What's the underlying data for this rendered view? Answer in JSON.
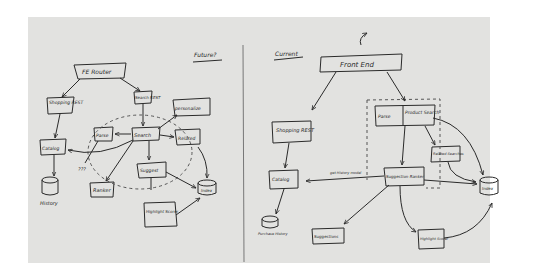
{
  "diagram": {
    "medium": "hand-drawn sketch on paper",
    "sections": {
      "future": {
        "title": "Future?",
        "nodes": {
          "fe_router": "FE Router",
          "shopping_rest": "Shopping REST",
          "search_rest": "Search REST",
          "personalize": "personalize",
          "search": "Search",
          "parse": "Parse",
          "related": "Related",
          "catalog": "Catalog",
          "history": "History",
          "unknown": "???",
          "ranker": "Ranker",
          "suggest": "Suggest",
          "index": "Index",
          "highlight_scorer": "Highlight Scorer"
        }
      },
      "current": {
        "title": "Current",
        "nodes": {
          "front_end": "Front End",
          "shopping_rest": "Shopping REST",
          "parse": "Parse",
          "product_search": "Product Search",
          "related_searches": "Related Searches",
          "catalog": "Catalog",
          "purchase_history": "Purchase History",
          "suggestion_ranker": "Suggestion Ranker",
          "index": "Index",
          "suggestions": "Suggestions",
          "highlight_scorer": "Highlight Scorer"
        },
        "edge_labels": {
          "get_history_model": "get History model"
        }
      }
    },
    "colors": {
      "paper": "#e2e2e0",
      "ink": "#2a2a2a",
      "background": "#ffffff"
    }
  }
}
